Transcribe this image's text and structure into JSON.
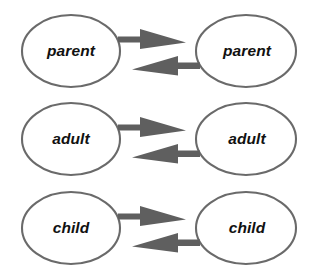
{
  "diagram": {
    "type": "node-edge-diagram",
    "background_color": "#ffffff",
    "node_fill": "#ffffff",
    "node_stroke": "#6a6a6a",
    "arrow_color": "#5f5f5f",
    "label_color": "#111111",
    "top_cropped_artifact": "",
    "rows": [
      {
        "id": "row-parent",
        "left_label": "parent",
        "right_label": "parent",
        "forward_arrow": "arrow-right",
        "backward_arrow": "arrow-left"
      },
      {
        "id": "row-adult",
        "left_label": "adult",
        "right_label": "adult",
        "forward_arrow": "arrow-right",
        "backward_arrow": "arrow-left"
      },
      {
        "id": "row-child",
        "left_label": "child",
        "right_label": "child",
        "forward_arrow": "arrow-right",
        "backward_arrow": "arrow-left"
      }
    ]
  }
}
